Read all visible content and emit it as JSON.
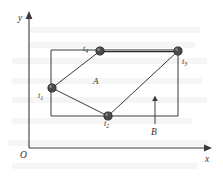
{
  "figure": {
    "kind": "physics-diagram",
    "canvas": {
      "width": 223,
      "height": 180
    },
    "background_color": "#ffffff",
    "line_color": "#3a3a3a",
    "node_color": "#4a4a4a"
  },
  "axes": {
    "origin_label": "O",
    "x_axis": {
      "label": "x",
      "line": {
        "x1": 29,
        "y1": 148,
        "x2": 205,
        "y2": 148
      },
      "arrow_tip": {
        "x": 211,
        "y": 148
      },
      "label_pos": {
        "x": 205,
        "y": 155
      }
    },
    "y_axis": {
      "label": "y",
      "line": {
        "x1": 29,
        "y1": 148,
        "x2": 29,
        "y2": 18
      },
      "arrow_tip": {
        "x": 29,
        "y": 12
      },
      "label_pos": {
        "x": 18,
        "y": 14
      }
    },
    "origin_pos": {
      "x": 20,
      "y": 151
    }
  },
  "rectangle": {
    "name": "rail-frame",
    "left": 51,
    "top": 50,
    "right": 178,
    "bottom": 116
  },
  "nodes": [
    {
      "id": "t1",
      "label": "t",
      "subscript": "1",
      "x": 52,
      "y": 88,
      "label_pos": {
        "x": 38,
        "y": 92
      }
    },
    {
      "id": "t2",
      "label": "t",
      "subscript": "2",
      "x": 108,
      "y": 116,
      "label_pos": {
        "x": 104,
        "y": 120
      }
    },
    {
      "id": "t3",
      "label": "t",
      "subscript": "3",
      "x": 178,
      "y": 51,
      "label_pos": {
        "x": 182,
        "y": 58
      }
    },
    {
      "id": "t4",
      "label": "t",
      "subscript": "4",
      "x": 100,
      "y": 51,
      "label_pos": {
        "x": 83,
        "y": 45
      }
    }
  ],
  "conductor_path": {
    "name": "moving-conductor-path",
    "segments": [
      {
        "from": "t1",
        "to": "t4",
        "style": "thin"
      },
      {
        "from": "t4",
        "to": "t3",
        "style": "rod"
      },
      {
        "from": "t3",
        "to": "t2",
        "style": "thin"
      },
      {
        "from": "t2",
        "to": "t1",
        "style": "thin"
      }
    ]
  },
  "area_label": {
    "text": "A",
    "pos": {
      "x": 93,
      "y": 77
    }
  },
  "field": {
    "label": "B",
    "direction": "up",
    "shaft": {
      "x": 155,
      "y_bottom": 124,
      "y_top": 100
    },
    "arrow_tip": {
      "x": 155,
      "y": 96
    },
    "label_pos": {
      "x": 151,
      "y": 128
    }
  },
  "ghost_rows": [
    {
      "x": 30,
      "y": 27,
      "w": 170
    },
    {
      "x": 30,
      "y": 42,
      "w": 165
    },
    {
      "x": 12,
      "y": 58,
      "w": 195
    },
    {
      "x": 12,
      "y": 78,
      "w": 190
    },
    {
      "x": 12,
      "y": 97,
      "w": 195
    },
    {
      "x": 12,
      "y": 118,
      "w": 180
    },
    {
      "x": 8,
      "y": 140,
      "w": 200
    },
    {
      "x": 12,
      "y": 163,
      "w": 185
    }
  ]
}
